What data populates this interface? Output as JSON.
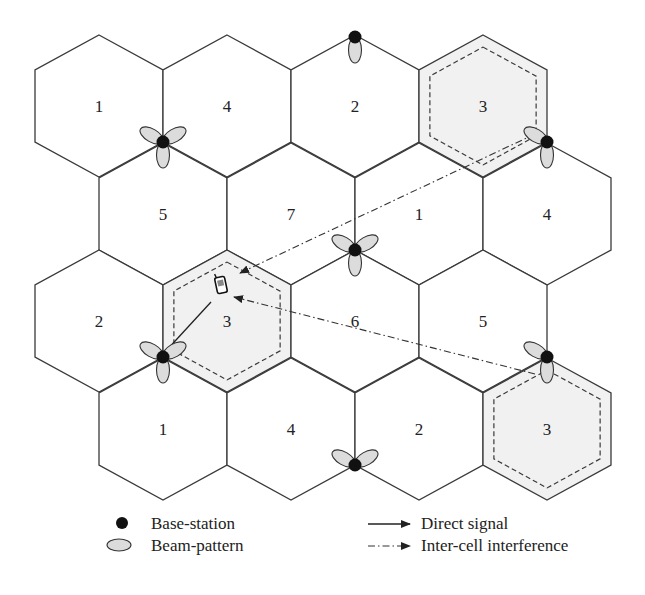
{
  "figure": {
    "type": "hexagonal-cellular-layout",
    "cells": [
      {
        "row": 0,
        "cx": 99,
        "cy": 106,
        "label": "1",
        "highlight": false
      },
      {
        "row": 0,
        "cx": 227,
        "cy": 106,
        "label": "4",
        "highlight": false
      },
      {
        "row": 0,
        "cx": 355,
        "cy": 106,
        "label": "2",
        "highlight": false
      },
      {
        "row": 0,
        "cx": 483,
        "cy": 106,
        "label": "3",
        "highlight": true
      },
      {
        "row": 1,
        "cx": 163,
        "cy": 214,
        "label": "5",
        "highlight": false
      },
      {
        "row": 1,
        "cx": 291,
        "cy": 214,
        "label": "7",
        "highlight": false
      },
      {
        "row": 1,
        "cx": 419,
        "cy": 214,
        "label": "1",
        "highlight": false
      },
      {
        "row": 1,
        "cx": 547,
        "cy": 214,
        "label": "4",
        "highlight": false
      },
      {
        "row": 2,
        "cx": 99,
        "cy": 321,
        "label": "2",
        "highlight": false
      },
      {
        "row": 2,
        "cx": 227,
        "cy": 321,
        "label": "3",
        "highlight": true
      },
      {
        "row": 2,
        "cx": 355,
        "cy": 321,
        "label": "6",
        "highlight": false
      },
      {
        "row": 2,
        "cx": 483,
        "cy": 321,
        "label": "5",
        "highlight": false
      },
      {
        "row": 3,
        "cx": 163,
        "cy": 429,
        "label": "1",
        "highlight": false
      },
      {
        "row": 3,
        "cx": 291,
        "cy": 429,
        "label": "4",
        "highlight": false
      },
      {
        "row": 3,
        "cx": 419,
        "cy": 429,
        "label": "2",
        "highlight": false
      },
      {
        "row": 3,
        "cx": 547,
        "cy": 429,
        "label": "3",
        "highlight": true
      }
    ],
    "base_stations": [
      {
        "x": 355,
        "y": 37,
        "beams": [
          180
        ]
      },
      {
        "x": 163,
        "y": 142,
        "beams": [
          -60,
          60,
          180
        ]
      },
      {
        "x": 547,
        "y": 142,
        "beams": [
          -60,
          180
        ]
      },
      {
        "x": 355,
        "y": 250,
        "beams": [
          -60,
          60,
          180
        ]
      },
      {
        "x": 163,
        "y": 357,
        "beams": [
          -60,
          60,
          180
        ]
      },
      {
        "x": 547,
        "y": 357,
        "beams": [
          -60,
          180
        ]
      },
      {
        "x": 355,
        "y": 465,
        "beams": [
          -60,
          60
        ]
      }
    ],
    "mobile": {
      "x": 221,
      "y": 285,
      "icon": "mobile-phone-icon"
    },
    "direct_signal": {
      "from": [
        165,
        352
      ],
      "to": [
        211,
        302
      ]
    },
    "interference": [
      {
        "from": [
          535,
          134
        ],
        "to": [
          240,
          273
        ]
      },
      {
        "from": [
          535,
          374
        ],
        "to": [
          234,
          297
        ]
      }
    ]
  },
  "legend": {
    "base_station": "Base-station",
    "beam_pattern": "Beam-pattern",
    "direct_signal": "Direct signal",
    "interference": "Inter-cell interference"
  }
}
